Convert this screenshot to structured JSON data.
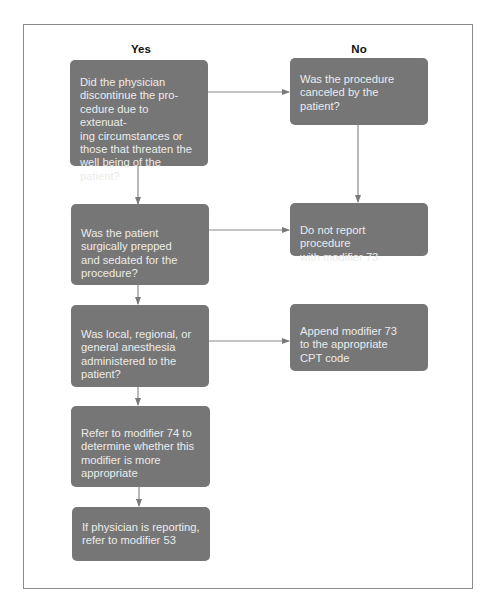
{
  "columns": {
    "yes": "Yes",
    "no": "No"
  },
  "nodes": [
    {
      "id": "q-discontinued",
      "text": "Did the physician\ndiscontinue the pro-\ncedure due to extenuat-\ning circumstances or\nthose that threaten the\nwell being of the patient?"
    },
    {
      "id": "q-canceled",
      "text": "Was the procedure\ncanceled by the\npatient?"
    },
    {
      "id": "q-prepped",
      "text": "Was the patient\nsurgically prepped\nand sedated for the\nprocedure?"
    },
    {
      "id": "a-do-not-report",
      "text": "Do not report procedure\nwith modifier 73"
    },
    {
      "id": "q-anesthesia",
      "text": "Was local, regional, or\ngeneral anesthesia\nadministered to the\npatient?"
    },
    {
      "id": "a-append-73",
      "text": "Append modifier 73\nto the appropriate\nCPT code"
    },
    {
      "id": "a-refer-74",
      "text": "Refer to modifier 74 to\ndetermine whether this\nmodifier is more\nappropriate"
    },
    {
      "id": "a-refer-53",
      "text": "If physician is reporting,\nrefer to modifier 53"
    }
  ],
  "edges": [
    {
      "from": "q-discontinued",
      "to": "q-canceled"
    },
    {
      "from": "q-discontinued",
      "to": "q-prepped"
    },
    {
      "from": "q-canceled",
      "to": "a-do-not-report"
    },
    {
      "from": "q-prepped",
      "to": "a-do-not-report"
    },
    {
      "from": "q-prepped",
      "to": "q-anesthesia"
    },
    {
      "from": "q-anesthesia",
      "to": "a-append-73"
    },
    {
      "from": "q-anesthesia",
      "to": "a-refer-74"
    },
    {
      "from": "a-refer-74",
      "to": "a-refer-53"
    }
  ],
  "colors": {
    "node_fill": "#767676",
    "node_text": "#ececec",
    "arrow": "#7a7a7a",
    "frame": "#8a8a8a"
  }
}
